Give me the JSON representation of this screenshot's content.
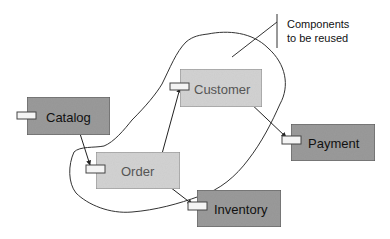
{
  "diagram": {
    "type": "component-diagram",
    "callout": {
      "lines": [
        "Components",
        "to be reused"
      ]
    },
    "colors": {
      "dark_component": "#9a9a9a",
      "light_component": "#d2d2d2",
      "port_fill": "#f4f4f4",
      "stroke": "#333333",
      "dark_text": "#111111",
      "light_text": "#555555"
    },
    "reused_group": {
      "label": "Components to be reused",
      "members": [
        "Customer",
        "Order"
      ]
    },
    "components": [
      {
        "id": "catalog",
        "label": "Catalog",
        "style": "dark"
      },
      {
        "id": "customer",
        "label": "Customer",
        "style": "light"
      },
      {
        "id": "order",
        "label": "Order",
        "style": "light"
      },
      {
        "id": "payment",
        "label": "Payment",
        "style": "dark"
      },
      {
        "id": "inventory",
        "label": "Inventory",
        "style": "dark"
      }
    ],
    "connections": [
      {
        "from": "Catalog",
        "to": "Order"
      },
      {
        "from": "Order",
        "to": "Customer"
      },
      {
        "from": "Customer",
        "to": "Payment"
      },
      {
        "from": "Order",
        "to": "Inventory"
      }
    ]
  }
}
